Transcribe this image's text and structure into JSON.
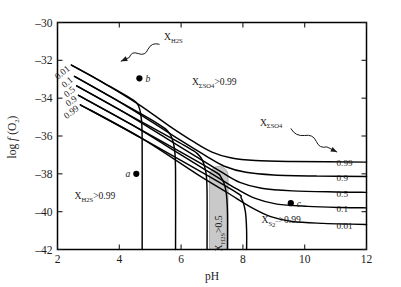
{
  "chart_data": {
    "type": "line",
    "title": "",
    "xlabel": "pH",
    "ylabel": "log f (O2)",
    "ylabel_parts": {
      "pre": "log ",
      "italic": "f",
      "mid": " (O",
      "sub": "2",
      "post": ")"
    },
    "xlim": [
      2,
      12
    ],
    "ylim": [
      -42,
      -30
    ],
    "xticks": [
      "2",
      "4",
      "6",
      "8",
      "10",
      "12"
    ],
    "yticks": [
      "-30",
      "-32",
      "-34",
      "-36",
      "-38",
      "-40",
      "-42"
    ],
    "grid": false,
    "legend_position": "none",
    "left_curve_labels": [
      "0.01",
      "0.1",
      "0.5",
      "0.9",
      "0.99"
    ],
    "right_curve_labels": [
      "0.99",
      "0.9",
      "0.5",
      "0.1",
      "0.01"
    ],
    "series": [
      {
        "name": "0.01",
        "points": [
          [
            2.45,
            -32.25
          ],
          [
            3.5,
            -33.2
          ],
          [
            4.4,
            -34.05
          ],
          [
            4.62,
            -34.4
          ],
          [
            4.72,
            -35.2
          ],
          [
            4.74,
            -36.6
          ],
          [
            4.74,
            -42.0
          ]
        ]
      },
      {
        "name": "0.1",
        "points": [
          [
            2.55,
            -32.85
          ],
          [
            3.8,
            -34.0
          ],
          [
            5.2,
            -35.3
          ],
          [
            5.62,
            -35.85
          ],
          [
            5.78,
            -36.6
          ],
          [
            5.82,
            -37.8
          ],
          [
            5.82,
            -42.0
          ]
        ]
      },
      {
        "name": "0.5",
        "points": [
          [
            2.62,
            -33.35
          ],
          [
            4.1,
            -34.7
          ],
          [
            6.1,
            -36.5
          ],
          [
            6.62,
            -37.1
          ],
          [
            6.8,
            -37.9
          ],
          [
            6.84,
            -39.0
          ],
          [
            6.84,
            -42.0
          ]
        ]
      },
      {
        "name": "0.9",
        "points": [
          [
            2.68,
            -33.85
          ],
          [
            4.4,
            -35.4
          ],
          [
            6.9,
            -37.7
          ],
          [
            7.3,
            -38.2
          ],
          [
            7.45,
            -38.9
          ],
          [
            7.5,
            -40.0
          ],
          [
            7.5,
            -42.0
          ]
        ]
      },
      {
        "name": "0.99",
        "points": [
          [
            2.74,
            -34.35
          ],
          [
            4.7,
            -36.1
          ],
          [
            7.6,
            -38.8
          ],
          [
            7.95,
            -39.3
          ],
          [
            8.08,
            -40.0
          ],
          [
            8.12,
            -41.0
          ],
          [
            8.12,
            -42.0
          ]
        ]
      },
      {
        "name": "0.99r",
        "points": [
          [
            2.45,
            -32.25
          ],
          [
            3.5,
            -33.2
          ],
          [
            4.6,
            -34.3
          ],
          [
            5.6,
            -35.45
          ],
          [
            6.4,
            -36.3
          ],
          [
            7.0,
            -36.85
          ],
          [
            7.6,
            -37.15
          ],
          [
            8.4,
            -37.3
          ],
          [
            9.6,
            -37.35
          ],
          [
            12,
            -37.38
          ]
        ]
      },
      {
        "name": "0.9r",
        "points": [
          [
            2.55,
            -32.85
          ],
          [
            3.8,
            -34.0
          ],
          [
            5.0,
            -35.2
          ],
          [
            6.0,
            -36.25
          ],
          [
            6.8,
            -37.05
          ],
          [
            7.4,
            -37.6
          ],
          [
            8.1,
            -37.92
          ],
          [
            9.0,
            -38.06
          ],
          [
            10.4,
            -38.12
          ],
          [
            12,
            -38.14
          ]
        ]
      },
      {
        "name": "0.5r",
        "points": [
          [
            2.62,
            -33.35
          ],
          [
            4.1,
            -34.7
          ],
          [
            5.5,
            -36.1
          ],
          [
            6.5,
            -37.1
          ],
          [
            7.3,
            -37.9
          ],
          [
            7.9,
            -38.45
          ],
          [
            8.6,
            -38.76
          ],
          [
            9.6,
            -38.9
          ],
          [
            11,
            -38.96
          ],
          [
            12,
            -38.98
          ]
        ]
      },
      {
        "name": "0.1r",
        "points": [
          [
            2.68,
            -33.85
          ],
          [
            4.4,
            -35.4
          ],
          [
            6.0,
            -37.0
          ],
          [
            7.0,
            -38.0
          ],
          [
            7.8,
            -38.8
          ],
          [
            8.4,
            -39.3
          ],
          [
            9.1,
            -39.6
          ],
          [
            10.1,
            -39.72
          ],
          [
            11.2,
            -39.78
          ],
          [
            12,
            -39.8
          ]
        ]
      },
      {
        "name": "0.01r",
        "points": [
          [
            2.74,
            -34.35
          ],
          [
            4.7,
            -36.1
          ],
          [
            6.5,
            -38.0
          ],
          [
            7.5,
            -39.0
          ],
          [
            8.3,
            -39.8
          ],
          [
            8.9,
            -40.26
          ],
          [
            9.6,
            -40.52
          ],
          [
            10.6,
            -40.62
          ],
          [
            11.5,
            -40.66
          ],
          [
            12,
            -40.68
          ]
        ]
      }
    ],
    "shaded_band": {
      "label": "X_H2S > 0.5",
      "x_range": [
        6.92,
        7.52
      ],
      "y_top": -37.6,
      "y_bottom": -42.0,
      "color": "#c9c9c9"
    },
    "points": [
      {
        "label": "a",
        "x": 4.55,
        "y": -38.0
      },
      {
        "label": "b",
        "x": 4.65,
        "y": -32.95
      },
      {
        "label": "c",
        "x": 9.55,
        "y": -39.55
      }
    ],
    "annotations": [
      {
        "name": "x-h2s-arrow-label",
        "text": "XH2S",
        "x": 5.3,
        "y": -30.85
      },
      {
        "name": "x-sso4-region-label",
        "text": "XΣSO4>0.99",
        "x": 7.1,
        "y": -33.35
      },
      {
        "name": "x-sso4-arrow-label",
        "text": "XΣSO4",
        "x": 9.6,
        "y": -35.5
      },
      {
        "name": "x-h2s-region-label",
        "text": "XH2S>0.99",
        "x": 3.55,
        "y": -39.4
      },
      {
        "name": "x-s2-region-label",
        "text": "XS2->0.99",
        "x": 9.45,
        "y": -40.55
      }
    ]
  },
  "labels": {
    "x_axis": "pH",
    "y_axis_pre": "log ",
    "y_axis_f": "f",
    "y_axis_mid": " (O",
    "y_axis_sub": "2",
    "y_axis_post": ")",
    "band_text_pre": "X",
    "band_text_sub": "H2S",
    "band_text_post": ">0.5",
    "h2s_arrow_x": "X",
    "h2s_arrow_sub": "H2S",
    "sso4_region_x": "X",
    "sso4_region_sub": "ΣSO4",
    "sso4_region_post": ">0.99",
    "sso4_arrow_x": "X",
    "sso4_arrow_sub": "ΣSO4",
    "h2s_region_x": "X",
    "h2s_region_sub": "H2S",
    "h2s_region_post": ">0.99",
    "s2_region_x": "X",
    "s2_region_sub": "S",
    "s2_region_sub2": "2",
    "s2_region_sup": "–",
    "s2_region_post": ">0.99",
    "pt_a": "a",
    "pt_b": "b",
    "pt_c": "c"
  },
  "ticks": {
    "x": [
      "2",
      "4",
      "6",
      "8",
      "10",
      "12"
    ],
    "y": [
      "-30",
      "-32",
      "-34",
      "-36",
      "-38",
      "-40",
      "-42"
    ]
  },
  "curve_labels": {
    "left": [
      "0.01",
      "0.1",
      "0.5",
      "0.9",
      "0.99"
    ],
    "right": [
      "0.99",
      "0.9",
      "0.5",
      "0.1",
      "0.01"
    ]
  },
  "colors": {
    "line": "#000000",
    "band": "#c9c9c9",
    "frame": "#000000",
    "text": "#1a1a1a",
    "background": "#ffffff"
  }
}
